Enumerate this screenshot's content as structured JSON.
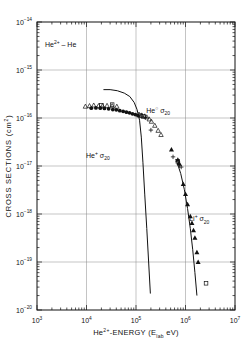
{
  "figure": {
    "name": "cross-section-vs-energy-log-log-plot",
    "background": "#ffffff",
    "ink_color": "#111111"
  },
  "chart_data": {
    "type": "scatter",
    "title": "",
    "plot_label": "He2+ - He",
    "xlabel": "He2+-ENERGY (Elab eV)",
    "ylabel": "CROSS SECTIONS (cm2)",
    "xscale": "log",
    "yscale": "log",
    "xlim": [
      1000,
      10000000
    ],
    "ylim": [
      1e-20,
      1e-14
    ],
    "grid": true,
    "legend_position": "none",
    "xticks": [
      1000,
      10000,
      100000,
      1000000,
      10000000
    ],
    "xticklabels": [
      "10 3",
      "10 4",
      "10 5",
      "10 6",
      "10 7"
    ],
    "yticks": [
      1e-20,
      1e-19,
      1e-18,
      1e-17,
      1e-16,
      1e-15,
      1e-14
    ],
    "yticklabels": [
      "10 -20",
      "10 -19",
      "10 -18",
      "10 -17",
      "10 -16",
      "10 -15",
      "10 -14"
    ],
    "annotations": [
      {
        "text": "He2+ - He",
        "x": 3000,
        "y": 3e-15,
        "name": "reaction-label"
      },
      {
        "text": "He0 s20",
        "x": 280000,
        "y": 1.3e-16,
        "name": "he0-sigma20-label"
      },
      {
        "text": "He+ s20",
        "x": 17000,
        "y": 1.5e-17,
        "name": "heplus-sigma20-label"
      },
      {
        "text": "Li+ s20",
        "x": 1900000,
        "y": 7e-19,
        "name": "liplus-sigma20-label"
      }
    ],
    "series": [
      {
        "name": "open-triangle-data",
        "marker": "open-triangle",
        "points": [
          [
            9500,
            1.75e-16
          ],
          [
            11500,
            1.8e-16
          ],
          [
            14000,
            1.85e-16
          ],
          [
            17500,
            1.8e-16
          ],
          [
            21000,
            1.8e-16
          ],
          [
            26000,
            1.82e-16
          ],
          [
            33000,
            1.8e-16
          ],
          [
            41000,
            1.75e-16
          ],
          [
            115000,
            1.2e-16
          ],
          [
            130000,
            1.15e-16
          ],
          [
            150000,
            1.1e-16
          ],
          [
            165000,
            1.05e-16
          ],
          [
            185000,
            9.5e-17
          ],
          [
            205000,
            8.5e-17
          ],
          [
            240000,
            7e-17
          ],
          [
            280000,
            5.5e-17
          ],
          [
            320000,
            4.5e-17
          ]
        ]
      },
      {
        "name": "filled-circle-data",
        "marker": "filled-circle",
        "points": [
          [
            12500,
            1.6e-16
          ],
          [
            15500,
            1.62e-16
          ],
          [
            19000,
            1.6e-16
          ],
          [
            23000,
            1.58e-16
          ],
          [
            28000,
            1.55e-16
          ],
          [
            34000,
            1.5e-16
          ],
          [
            40000,
            1.48e-16
          ],
          [
            47000,
            1.42e-16
          ],
          [
            55000,
            1.38e-16
          ],
          [
            64000,
            1.32e-16
          ],
          [
            74000,
            1.28e-16
          ],
          [
            85000,
            1.22e-16
          ],
          [
            97000,
            1.18e-16
          ],
          [
            110000,
            1.12e-16
          ]
        ]
      },
      {
        "name": "open-square-data",
        "marker": "open-square",
        "points": [
          [
            20000,
            1.85e-16
          ],
          [
            33000,
            1.9e-16
          ],
          [
            125000,
            1.12e-16
          ],
          [
            140000,
            1.08e-16
          ],
          [
            700000,
            1.25e-17
          ],
          [
            2600000,
            3.6e-20
          ]
        ]
      },
      {
        "name": "plus-data",
        "marker": "plus",
        "points": [
          [
            155000,
            1.02e-16
          ],
          [
            200000,
            5.6e-17
          ],
          [
            560000,
            1.55e-17
          ],
          [
            760000,
            1.02e-17
          ],
          [
            820000,
            9.5e-18
          ]
        ]
      },
      {
        "name": "filled-triangle-data",
        "marker": "filled-triangle",
        "points": [
          [
            520000,
            2.2e-17
          ],
          [
            700000,
            1.35e-17
          ],
          [
            740000,
            1.15e-17
          ],
          [
            900000,
            4.2e-18
          ],
          [
            1000000,
            2.6e-18
          ],
          [
            1100000,
            1.6e-18
          ],
          [
            1250000,
            9e-19
          ],
          [
            1350000,
            6.5e-19
          ],
          [
            1450000,
            4.6e-19
          ],
          [
            1550000,
            3.2e-19
          ],
          [
            1700000,
            1.6e-19
          ],
          [
            1800000,
            1e-19
          ]
        ]
      }
    ],
    "curves": [
      {
        "name": "heplus-sigma20-theory-curve",
        "points": [
          [
            22000,
            3.9e-16
          ],
          [
            30000,
            3.9e-16
          ],
          [
            42000,
            3.7e-16
          ],
          [
            58000,
            3.3e-16
          ],
          [
            75000,
            2.8e-16
          ],
          [
            92000,
            2.1e-16
          ],
          [
            105000,
            1.5e-16
          ],
          [
            118000,
            9e-17
          ],
          [
            128000,
            4e-17
          ],
          [
            138000,
            1.2e-17
          ],
          [
            150000,
            2.6e-18
          ],
          [
            165000,
            5e-19
          ],
          [
            180000,
            1e-19
          ],
          [
            195000,
            2.2e-20
          ]
        ]
      },
      {
        "name": "liplus-sigma20-theory-curve",
        "points": [
          [
            640000,
            1.4e-17
          ],
          [
            800000,
            7e-18
          ],
          [
            950000,
            3.2e-18
          ],
          [
            1100000,
            1.3e-18
          ],
          [
            1250000,
            5e-19
          ],
          [
            1400000,
            1.8e-19
          ],
          [
            1550000,
            6e-20
          ],
          [
            1700000,
            2e-20
          ]
        ]
      }
    ]
  }
}
